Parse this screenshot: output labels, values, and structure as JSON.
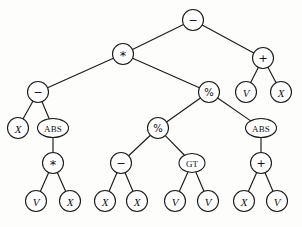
{
  "figure": {
    "type": "expression-tree",
    "width": 302,
    "height": 227,
    "background_color": "#fdfdfb",
    "stroke_color": "#1a1a1a",
    "node_fill_color": "#ffffff"
  },
  "nodes": [
    {
      "id": "n0",
      "label": "−",
      "kind": "op",
      "x": 193,
      "y": 20,
      "rx": 10.5,
      "ry": 10.5,
      "font_size": 11
    },
    {
      "id": "n1",
      "label": "*",
      "kind": "op",
      "x": 123,
      "y": 54,
      "rx": 10.5,
      "ry": 10.5,
      "font_size": 13
    },
    {
      "id": "n2",
      "label": "+",
      "kind": "op",
      "x": 263,
      "y": 58,
      "rx": 10.5,
      "ry": 10.5,
      "font_size": 11
    },
    {
      "id": "n3",
      "label": "−",
      "kind": "op",
      "x": 38,
      "y": 92,
      "rx": 10.5,
      "ry": 10.5,
      "font_size": 11
    },
    {
      "id": "n4",
      "label": "%",
      "kind": "op",
      "x": 209,
      "y": 92,
      "rx": 10.5,
      "ry": 10.5,
      "font_size": 10
    },
    {
      "id": "n5",
      "label": "V",
      "kind": "term",
      "x": 246,
      "y": 92,
      "rx": 10.5,
      "ry": 10.5,
      "font_size": 11
    },
    {
      "id": "n6",
      "label": "X",
      "kind": "term",
      "x": 281,
      "y": 92,
      "rx": 10.5,
      "ry": 10.5,
      "font_size": 11
    },
    {
      "id": "n7",
      "label": "X",
      "kind": "term",
      "x": 18,
      "y": 128,
      "rx": 10.5,
      "ry": 10.5,
      "font_size": 11
    },
    {
      "id": "n8",
      "label": "ABS",
      "kind": "word",
      "x": 53,
      "y": 128,
      "rx": 15.5,
      "ry": 9.5,
      "font_size": 9
    },
    {
      "id": "n9",
      "label": "%",
      "kind": "op",
      "x": 158,
      "y": 128,
      "rx": 10.5,
      "ry": 10.5,
      "font_size": 10
    },
    {
      "id": "n10",
      "label": "ABS",
      "kind": "word",
      "x": 261,
      "y": 128,
      "rx": 15.5,
      "ry": 9.5,
      "font_size": 9
    },
    {
      "id": "n11",
      "label": "*",
      "kind": "op",
      "x": 53,
      "y": 163,
      "rx": 10.5,
      "ry": 10.5,
      "font_size": 13
    },
    {
      "id": "n12",
      "label": "−",
      "kind": "op",
      "x": 121,
      "y": 163,
      "rx": 10.5,
      "ry": 10.5,
      "font_size": 11
    },
    {
      "id": "n13",
      "label": "GT",
      "kind": "word",
      "x": 192,
      "y": 163,
      "rx": 13.0,
      "ry": 9.5,
      "font_size": 9
    },
    {
      "id": "n14",
      "label": "+",
      "kind": "op",
      "x": 261,
      "y": 163,
      "rx": 10.5,
      "ry": 10.5,
      "font_size": 11
    },
    {
      "id": "n15",
      "label": "V",
      "kind": "term",
      "x": 36,
      "y": 201,
      "rx": 10.5,
      "ry": 10.5,
      "font_size": 11
    },
    {
      "id": "n16",
      "label": "X",
      "kind": "term",
      "x": 70,
      "y": 201,
      "rx": 10.5,
      "ry": 10.5,
      "font_size": 11
    },
    {
      "id": "n17",
      "label": "X",
      "kind": "term",
      "x": 105,
      "y": 201,
      "rx": 10.5,
      "ry": 10.5,
      "font_size": 11
    },
    {
      "id": "n18",
      "label": "X",
      "kind": "term",
      "x": 137,
      "y": 201,
      "rx": 10.5,
      "ry": 10.5,
      "font_size": 11
    },
    {
      "id": "n19",
      "label": "V",
      "kind": "term",
      "x": 175,
      "y": 201,
      "rx": 10.5,
      "ry": 10.5,
      "font_size": 11
    },
    {
      "id": "n20",
      "label": "V",
      "kind": "term",
      "x": 208,
      "y": 201,
      "rx": 10.5,
      "ry": 10.5,
      "font_size": 11
    },
    {
      "id": "n21",
      "label": "X",
      "kind": "term",
      "x": 244,
      "y": 201,
      "rx": 10.5,
      "ry": 10.5,
      "font_size": 11
    },
    {
      "id": "n22",
      "label": "V",
      "kind": "term",
      "x": 277,
      "y": 201,
      "rx": 10.5,
      "ry": 10.5,
      "font_size": 11
    }
  ],
  "edges": [
    {
      "from": "n0",
      "to": "n1"
    },
    {
      "from": "n0",
      "to": "n2"
    },
    {
      "from": "n1",
      "to": "n3"
    },
    {
      "from": "n1",
      "to": "n4"
    },
    {
      "from": "n2",
      "to": "n5"
    },
    {
      "from": "n2",
      "to": "n6"
    },
    {
      "from": "n3",
      "to": "n7"
    },
    {
      "from": "n3",
      "to": "n8"
    },
    {
      "from": "n4",
      "to": "n9"
    },
    {
      "from": "n4",
      "to": "n10"
    },
    {
      "from": "n8",
      "to": "n11"
    },
    {
      "from": "n9",
      "to": "n12"
    },
    {
      "from": "n9",
      "to": "n13"
    },
    {
      "from": "n10",
      "to": "n14"
    },
    {
      "from": "n11",
      "to": "n15"
    },
    {
      "from": "n11",
      "to": "n16"
    },
    {
      "from": "n12",
      "to": "n17"
    },
    {
      "from": "n12",
      "to": "n18"
    },
    {
      "from": "n13",
      "to": "n19"
    },
    {
      "from": "n13",
      "to": "n20"
    },
    {
      "from": "n14",
      "to": "n21"
    },
    {
      "from": "n14",
      "to": "n22"
    }
  ]
}
